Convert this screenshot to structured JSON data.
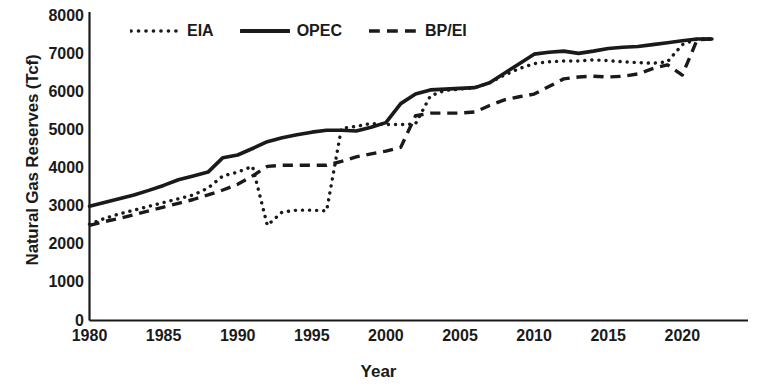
{
  "chart_data": {
    "type": "line",
    "title": "",
    "xlabel": "Year",
    "ylabel": "Natural Gas Reserves (Tcf)",
    "xlim": [
      1980,
      2022
    ],
    "ylim": [
      0,
      8000
    ],
    "xticks": [
      1980,
      1985,
      1990,
      1995,
      2000,
      2005,
      2010,
      2015,
      2020
    ],
    "yticks": [
      0,
      1000,
      2000,
      3000,
      4000,
      5000,
      6000,
      7000,
      8000
    ],
    "grid": false,
    "legend_position": "top-center",
    "x": [
      1980,
      1981,
      1982,
      1983,
      1984,
      1985,
      1986,
      1987,
      1988,
      1989,
      1990,
      1991,
      1992,
      1993,
      1994,
      1995,
      1996,
      1997,
      1998,
      1999,
      2000,
      2001,
      2002,
      2003,
      2004,
      2005,
      2006,
      2007,
      2008,
      2009,
      2010,
      2011,
      2012,
      2013,
      2014,
      2015,
      2016,
      2017,
      2018,
      2019,
      2020,
      2021,
      2022
    ],
    "series": [
      {
        "name": "EIA",
        "style": "dotted",
        "color": "#1a1a1a",
        "values": [
          2530,
          2680,
          2800,
          2900,
          3000,
          3100,
          3200,
          3300,
          3480,
          3800,
          3900,
          4050,
          2500,
          2850,
          2900,
          2900,
          2880,
          5050,
          5100,
          5180,
          5150,
          5150,
          5170,
          5900,
          6050,
          6080,
          6120,
          6250,
          6450,
          6620,
          6750,
          6800,
          6820,
          6820,
          6850,
          6830,
          6800,
          6780,
          6760,
          6800,
          7250,
          7400,
          7400
        ]
      },
      {
        "name": "OPEC",
        "style": "solid",
        "color": "#1a1a1a",
        "values": [
          3000,
          3100,
          3200,
          3300,
          3420,
          3550,
          3700,
          3800,
          3900,
          4280,
          4350,
          4520,
          4700,
          4800,
          4880,
          4950,
          5000,
          5000,
          4980,
          5080,
          5200,
          5700,
          5950,
          6060,
          6080,
          6100,
          6120,
          6250,
          6500,
          6750,
          7000,
          7050,
          7080,
          7020,
          7080,
          7150,
          7180,
          7200,
          7250,
          7300,
          7350,
          7400,
          7400
        ]
      },
      {
        "name": "BP/EI",
        "style": "dashed",
        "color": "#1a1a1a",
        "values": [
          2500,
          2600,
          2680,
          2780,
          2880,
          2980,
          3080,
          3180,
          3300,
          3430,
          3580,
          3800,
          4050,
          4080,
          4080,
          4080,
          4080,
          4180,
          4300,
          4380,
          4450,
          4550,
          5380,
          5450,
          5450,
          5450,
          5480,
          5650,
          5800,
          5880,
          5950,
          6150,
          6350,
          6400,
          6420,
          6400,
          6420,
          6480,
          6620,
          6720,
          6450,
          7380,
          7400
        ]
      }
    ]
  },
  "axes": {
    "y_title": "Natural Gas Reserves (Tcf)",
    "x_title": "Year",
    "y_tick_labels": [
      "8000",
      "7000",
      "6000",
      "5000",
      "4000",
      "3000",
      "2000",
      "1000",
      "0"
    ],
    "x_tick_labels": [
      "1980",
      "1985",
      "1990",
      "1995",
      "2000",
      "2005",
      "2010",
      "2015",
      "2020"
    ]
  },
  "legend": {
    "items": [
      {
        "label": "EIA",
        "style": "dotted"
      },
      {
        "label": "OPEC",
        "style": "solid"
      },
      {
        "label": "BP/EI",
        "style": "dashed"
      }
    ]
  }
}
